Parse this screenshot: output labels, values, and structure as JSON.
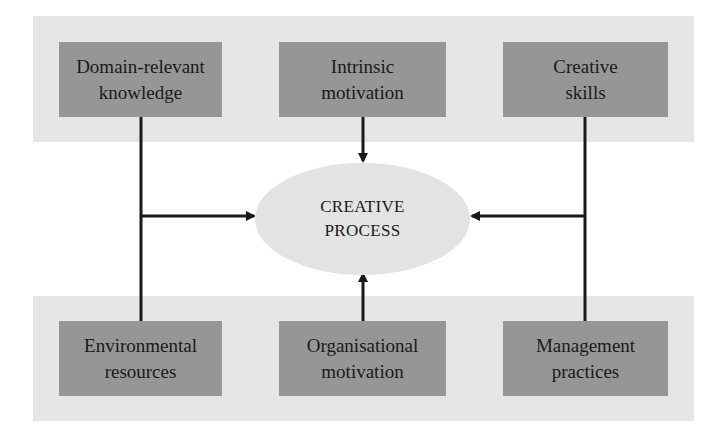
{
  "diagram": {
    "top_row": [
      {
        "line1": "Domain-relevant",
        "line2": "knowledge"
      },
      {
        "line1": "Intrinsic",
        "line2": "motivation"
      },
      {
        "line1": "Creative",
        "line2": "skills"
      }
    ],
    "center": {
      "line1": "CREATIVE",
      "line2": "PROCESS"
    },
    "bottom_row": [
      {
        "line1": "Environmental",
        "line2": "resources"
      },
      {
        "line1": "Organisational",
        "line2": "motivation"
      },
      {
        "line1": "Management",
        "line2": "practices"
      }
    ],
    "colors": {
      "band": "#e6e6e6",
      "box": "#969696",
      "ellipse": "#e3e3e3",
      "line": "#1a1a1a"
    }
  }
}
